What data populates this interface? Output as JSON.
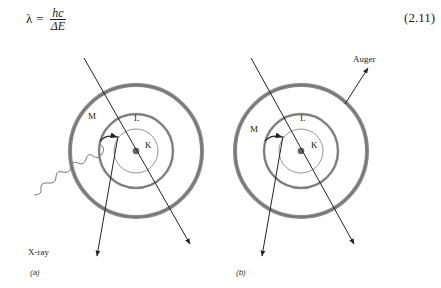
{
  "equation": {
    "lhs": "λ",
    "equals": "=",
    "numerator": "hc",
    "denominator": "ΔE",
    "number": "(2.11)"
  },
  "figure": {
    "panels": [
      {
        "id": "a",
        "caption": "(a)",
        "shells": [
          "K",
          "L",
          "M"
        ],
        "emission_label": "X-ray"
      },
      {
        "id": "b",
        "caption": "(b)",
        "shells": [
          "K",
          "L",
          "M"
        ],
        "emission_label": "Auger"
      }
    ]
  }
}
